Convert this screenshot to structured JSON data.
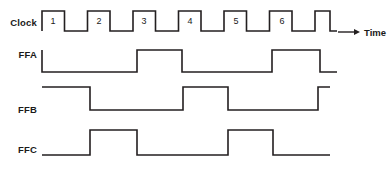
{
  "figure": {
    "type": "digital-timing-diagram",
    "background_color": "#ffffff",
    "trace_color": "#231f20",
    "text_color": "#1a1a1a",
    "width": 391,
    "height": 169
  },
  "axis": {
    "time_label": "Time",
    "arrow_name": "time-arrow",
    "arrow_x_start": 338,
    "arrow_x_end": 360,
    "arrow_y": 32
  },
  "rows": {
    "clock": {
      "label": "Clock"
    },
    "ffa": {
      "label": "FFA"
    },
    "ffb": {
      "label": "FFB"
    },
    "ffc": {
      "label": "FFC"
    }
  },
  "clock_numbers": [
    {
      "text": "1",
      "x": 46
    },
    {
      "text": "2",
      "x": 92
    },
    {
      "text": "3",
      "x": 137
    },
    {
      "text": "4",
      "x": 183
    },
    {
      "text": "5",
      "x": 229
    },
    {
      "text": "6",
      "x": 275
    }
  ],
  "chart_data": {
    "type": "line",
    "title": "",
    "xlabel": "Time",
    "ylabel": "",
    "grid": false,
    "legend_position": "left-labels",
    "x_start": 42,
    "x_end": 337,
    "clock_period_px": 45.7,
    "clock_cycles": 6,
    "series": [
      {
        "name": "Clock",
        "level_high_y": 11,
        "level_low_y": 31,
        "start_level": 0,
        "transitions_x": [
          42,
          64.5,
          87.5,
          110,
          133,
          155.5,
          178.5,
          201,
          224,
          246.5,
          269.5,
          292,
          315,
          330
        ],
        "end_x": 337,
        "end_level": 1
      },
      {
        "name": "FFA",
        "level_high_y": 50,
        "level_low_y": 72,
        "start_level": 1,
        "transitions_x": [
          42,
          137,
          182,
          272,
          320
        ],
        "end_x": 337,
        "end_level": 0
      },
      {
        "name": "FFB",
        "level_high_y": 87,
        "level_low_y": 110,
        "start_level": 1,
        "transitions_x": [
          90,
          183,
          228,
          318
        ],
        "end_x": 330,
        "end_level": 1
      },
      {
        "name": "FFC",
        "level_high_y": 130,
        "level_low_y": 155,
        "start_level": 0,
        "transitions_x": [
          90,
          137,
          228,
          273
        ],
        "end_x": 330,
        "end_level": 0
      }
    ]
  }
}
